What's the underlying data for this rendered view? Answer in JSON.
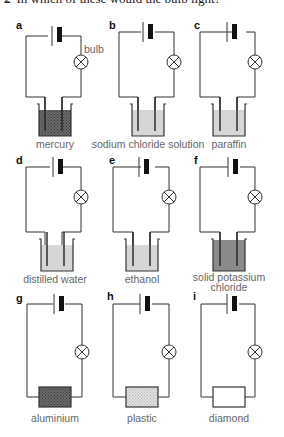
{
  "question": {
    "number": "2",
    "text": "In which of these would the bulb light?"
  },
  "annotations": {
    "bulb_label": "bulb"
  },
  "colors": {
    "wire": "#333333",
    "battery": "#111111",
    "caption": "#666666",
    "liquid_dark": "#5a5a5a",
    "liquid_light": "#d6d6d6",
    "solid_dark": "#777777",
    "solid_light": "#d8d8d8"
  },
  "panels": [
    {
      "id": "a",
      "letter": "a",
      "caption": "mercury",
      "type": "beaker",
      "fill": "dark-hatched"
    },
    {
      "id": "b",
      "letter": "b",
      "caption": "sodium chloride solution",
      "type": "beaker",
      "fill": "light"
    },
    {
      "id": "c",
      "letter": "c",
      "caption": "paraffin",
      "type": "beaker",
      "fill": "light"
    },
    {
      "id": "d",
      "letter": "d",
      "caption": "distilled water",
      "type": "beaker",
      "fill": "light"
    },
    {
      "id": "e",
      "letter": "e",
      "caption": "ethanol",
      "type": "beaker",
      "fill": "light"
    },
    {
      "id": "f",
      "letter": "f",
      "caption_line1": "solid potassium",
      "caption_line2": "chloride",
      "type": "beaker",
      "fill": "medium"
    },
    {
      "id": "g",
      "letter": "g",
      "caption": "aluminium",
      "type": "block",
      "fill": "dark-hatched"
    },
    {
      "id": "h",
      "letter": "h",
      "caption": "plastic",
      "type": "block",
      "fill": "light-dotted"
    },
    {
      "id": "i",
      "letter": "i",
      "caption": "diamond",
      "type": "block",
      "fill": "empty"
    }
  ]
}
